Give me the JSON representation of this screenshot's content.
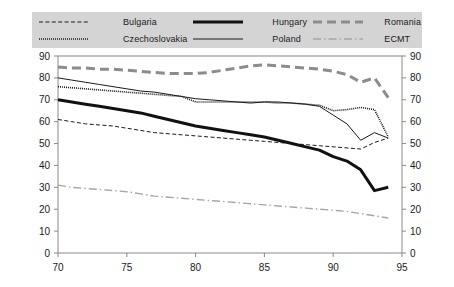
{
  "legend": {
    "background_color": "#d4d4d4",
    "entries": [
      {
        "label": "Bulgaria",
        "key": "dashed-thin-black",
        "color": "#1a1a1a",
        "width": 1,
        "dash": "4,2.4"
      },
      {
        "label": "Czechoslovakia",
        "key": "dotted-thin-black",
        "color": "#1a1a1a",
        "width": 1.6,
        "dash": "1,1"
      },
      {
        "label": "Hungary",
        "key": "solid-thick-black",
        "color": "#111111",
        "width": 3,
        "dash": "none"
      },
      {
        "label": "Poland",
        "key": "solid-thin-black",
        "color": "#1a1a1a",
        "width": 1,
        "dash": "none"
      },
      {
        "label": "Romania",
        "key": "dashed-thick-gray",
        "color": "#8c8c8c",
        "width": 3,
        "dash": "9,5"
      },
      {
        "label": "ECMT",
        "key": "dashdot-thin-gray",
        "color": "#a6a6a6",
        "width": 1.4,
        "dash": "8,3,1.5,3"
      }
    ]
  },
  "axes": {
    "x_label": "",
    "y_label": "",
    "x_ticks": [
      "70",
      "75",
      "80",
      "85",
      "90",
      "95"
    ],
    "y_ticks_left": [
      "0",
      "10",
      "20",
      "30",
      "40",
      "50",
      "60",
      "70",
      "80",
      "90"
    ],
    "y_ticks_right": [
      "0",
      "10",
      "20",
      "30",
      "40",
      "50",
      "60",
      "70",
      "80",
      "90"
    ]
  },
  "chart_data": {
    "type": "line",
    "title": "",
    "xlabel": "",
    "ylabel": "",
    "xlim": [
      70,
      95
    ],
    "ylim": [
      0,
      90
    ],
    "grid": false,
    "legend_position": "top",
    "x": [
      70,
      71,
      72,
      73,
      74,
      75,
      76,
      77,
      78,
      79,
      80,
      81,
      82,
      83,
      84,
      85,
      86,
      87,
      88,
      89,
      90,
      91,
      92,
      93,
      94
    ],
    "series": [
      {
        "name": "Bulgaria",
        "values": [
          61,
          60,
          59,
          58.5,
          58,
          57,
          56,
          55,
          54.5,
          54,
          53.5,
          53,
          52.5,
          52,
          51.5,
          51,
          50.5,
          50,
          49.5,
          49,
          48.5,
          48,
          47.5,
          50.5,
          52.5
        ]
      },
      {
        "name": "Czechoslovakia",
        "values": [
          76,
          75.5,
          75,
          74.5,
          74,
          73.5,
          73,
          72.5,
          72,
          71.5,
          69,
          69,
          69,
          69,
          69,
          69,
          68.5,
          68.5,
          68,
          67.5,
          65,
          65.5,
          66.5,
          65.5,
          53
        ]
      },
      {
        "name": "Hungary",
        "values": [
          70,
          69,
          68,
          67,
          66,
          65,
          64,
          62.5,
          61,
          59.5,
          58,
          57,
          56,
          55,
          54,
          53,
          51.5,
          50,
          48.5,
          47,
          44,
          42,
          38,
          28.5,
          30
        ]
      },
      {
        "name": "Poland",
        "values": [
          80,
          79,
          78,
          77,
          76,
          75,
          74,
          73.5,
          72.5,
          71.5,
          70.5,
          70,
          69.5,
          69,
          68.5,
          69,
          69,
          68.5,
          68,
          67,
          63,
          59,
          51.5,
          55,
          52.5
        ]
      },
      {
        "name": "Romania",
        "values": [
          85,
          84.5,
          84.5,
          84,
          84,
          83.5,
          83,
          82.5,
          82,
          82,
          82,
          82.5,
          83.5,
          84.5,
          85.5,
          86,
          85.5,
          85,
          84.5,
          84,
          83,
          81.5,
          78,
          80,
          71
        ]
      },
      {
        "name": "ECMT",
        "values": [
          31,
          30,
          29.5,
          29,
          28.5,
          28,
          27,
          26,
          25.5,
          25,
          24.5,
          24,
          23.5,
          23,
          22.5,
          22,
          21.5,
          21,
          20.5,
          20,
          19.5,
          19,
          18,
          17,
          16
        ]
      }
    ]
  }
}
